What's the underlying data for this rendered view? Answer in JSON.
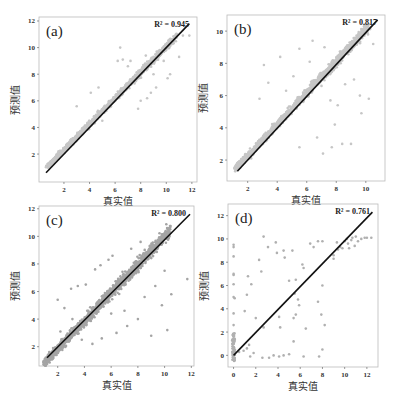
{
  "chart_data": [
    {
      "type": "scatter",
      "panel": "(a)",
      "r2_label": "R² = 0.945",
      "xlabel": "真实值",
      "ylabel": "预测值",
      "xticks": [
        2,
        4,
        6,
        8,
        10,
        12
      ],
      "yticks": [
        2,
        4,
        6,
        8,
        10,
        12
      ],
      "xlim": [
        0.05,
        12.4
      ],
      "ylim": [
        -0.1,
        12.3
      ],
      "box": [
        39,
        17,
        197,
        182
      ],
      "point_color": "#c6c6c6",
      "fit_line": [
        [
          0.6,
          0.6
        ],
        [
          11.8,
          11.8
        ]
      ],
      "seed": 1,
      "dense_spread": 0.45,
      "dense_offset": 0.35,
      "dense_range": [
        0.7,
        10.8
      ],
      "outliers": [
        [
          6.2,
          9.0
        ],
        [
          6.6,
          9.1
        ],
        [
          7.2,
          9.0
        ],
        [
          8.5,
          6.2
        ],
        [
          8.8,
          6.6
        ],
        [
          9.2,
          7.0
        ],
        [
          9.0,
          8.0
        ],
        [
          10.3,
          8.0
        ],
        [
          11.0,
          9.3
        ],
        [
          8.0,
          6.0
        ],
        [
          7.5,
          7.6
        ],
        [
          6.4,
          10.0
        ],
        [
          3.0,
          5.6
        ],
        [
          4.1,
          6.6
        ],
        [
          10.6,
          10.6
        ],
        [
          11.3,
          10.9
        ],
        [
          11.8,
          10.9
        ],
        [
          5.0,
          4.5
        ],
        [
          7.0,
          8.6
        ],
        [
          8.4,
          9.4
        ],
        [
          9.8,
          9.0
        ],
        [
          10.1,
          7.7
        ],
        [
          6.9,
          7.2
        ],
        [
          4.7,
          7.0
        ],
        [
          7.8,
          5.4
        ]
      ]
    },
    {
      "type": "scatter",
      "panel": "(b)",
      "r2_label": "R² = 0.817",
      "xlabel": "真实值",
      "ylabel": "预测值",
      "xticks": [
        2,
        4,
        6,
        8,
        10
      ],
      "yticks": [
        2,
        4,
        6,
        8,
        10
      ],
      "xlim": [
        0.6,
        11.3
      ],
      "ylim": [
        0.7,
        11.0
      ],
      "box": [
        227,
        15,
        385,
        181
      ],
      "point_color": "#c6c6c6",
      "fit_line": [
        [
          1.3,
          1.3
        ],
        [
          10.8,
          10.7
        ]
      ],
      "seed": 2,
      "dense_spread": 0.5,
      "dense_offset": 0.3,
      "dense_range": [
        1.2,
        10.2
      ],
      "outliers": [
        [
          3.4,
          6.8
        ],
        [
          3.1,
          7.9
        ],
        [
          4.2,
          8.4
        ],
        [
          5.5,
          8.9
        ],
        [
          6.2,
          8.1
        ],
        [
          7.0,
          6.6
        ],
        [
          7.6,
          5.7
        ],
        [
          8.1,
          5.4
        ],
        [
          8.6,
          6.7
        ],
        [
          9.2,
          7.0
        ],
        [
          9.6,
          6.0
        ],
        [
          9.7,
          4.9
        ],
        [
          10.2,
          5.8
        ],
        [
          9.0,
          3.0
        ],
        [
          8.4,
          3.0
        ],
        [
          7.7,
          2.8
        ],
        [
          7.1,
          2.4
        ],
        [
          5.5,
          2.8
        ],
        [
          6.7,
          3.4
        ],
        [
          7.9,
          4.2
        ],
        [
          8.9,
          9.0
        ],
        [
          6.4,
          9.4
        ],
        [
          7.2,
          9.0
        ],
        [
          2.8,
          5.8
        ],
        [
          3.8,
          4.0
        ],
        [
          3.0,
          3.2
        ],
        [
          10.5,
          9.2
        ],
        [
          4.6,
          6.3
        ],
        [
          5.1,
          7.2
        ],
        [
          8.3,
          8.0
        ]
      ]
    },
    {
      "type": "scatter",
      "panel": "(c)",
      "r2_label": "R² = 0.800",
      "xlabel": "真实值",
      "ylabel": "预测值",
      "xticks": [
        2,
        4,
        6,
        8,
        10,
        12
      ],
      "yticks": [
        2,
        4,
        6,
        8,
        10,
        12
      ],
      "xlim": [
        0.6,
        12.2
      ],
      "ylim": [
        0.6,
        12.2
      ],
      "box": [
        39,
        206,
        194,
        366
      ],
      "point_color": "#a4a4a4",
      "fit_line": [
        [
          1.2,
          1.2
        ],
        [
          11.9,
          11.6
        ]
      ],
      "seed": 3,
      "dense_spread": 0.8,
      "dense_offset": -0.2,
      "dense_range": [
        1.0,
        10.4
      ],
      "outliers": [
        [
          2.0,
          5.4
        ],
        [
          2.5,
          4.8
        ],
        [
          3.0,
          6.2
        ],
        [
          3.5,
          6.4
        ],
        [
          4.1,
          6.5
        ],
        [
          4.8,
          7.6
        ],
        [
          5.2,
          7.9
        ],
        [
          5.8,
          8.3
        ],
        [
          6.1,
          8.6
        ],
        [
          7.5,
          9.1
        ],
        [
          8.2,
          9.6
        ],
        [
          3.8,
          2.5
        ],
        [
          4.6,
          2.2
        ],
        [
          5.3,
          2.6
        ],
        [
          6.4,
          3.0
        ],
        [
          7.2,
          3.5
        ],
        [
          8.0,
          4.0
        ],
        [
          9.0,
          2.8
        ],
        [
          10.2,
          3.2
        ],
        [
          10.5,
          5.8
        ],
        [
          11.7,
          6.9
        ],
        [
          9.8,
          5.0
        ],
        [
          8.5,
          5.6
        ],
        [
          7.0,
          4.6
        ],
        [
          6.0,
          4.4
        ],
        [
          2.2,
          3.1
        ],
        [
          3.1,
          4.0
        ],
        [
          10.0,
          7.5
        ],
        [
          9.3,
          6.4
        ]
      ]
    },
    {
      "type": "scatter",
      "panel": "(d)",
      "r2_label": "R² = 0.761",
      "xlabel": "真实值",
      "ylabel": "预测值",
      "xticks": [
        0,
        2,
        4,
        6,
        8,
        10,
        12
      ],
      "yticks": [
        0,
        2,
        4,
        6,
        8,
        10,
        12
      ],
      "xlim": [
        -0.5,
        13.0
      ],
      "ylim": [
        -1.0,
        13.0
      ],
      "box": [
        228,
        204,
        378,
        367
      ],
      "point_color": "#b0b0b0",
      "fit_line": [
        [
          0,
          0
        ],
        [
          12.5,
          12.3
        ]
      ],
      "seed": 4,
      "outliers": [
        [
          0,
          9.5
        ],
        [
          0,
          9.3
        ],
        [
          0,
          8.5
        ],
        [
          0,
          7.0
        ],
        [
          0,
          6.9
        ],
        [
          0,
          6.1
        ],
        [
          0,
          5.0
        ],
        [
          0,
          3.6
        ],
        [
          0,
          2.6
        ],
        [
          0.1,
          4.9
        ],
        [
          1.0,
          3.8
        ],
        [
          1.2,
          5.2
        ],
        [
          1.3,
          6.8
        ],
        [
          1.6,
          6.1
        ],
        [
          2.3,
          8.2
        ],
        [
          2.5,
          7.2
        ],
        [
          2.7,
          10.2
        ],
        [
          3.1,
          9.3
        ],
        [
          3.8,
          9.7
        ],
        [
          3.9,
          8.8
        ],
        [
          4.5,
          9.0
        ],
        [
          4.6,
          8.4
        ],
        [
          5.3,
          9.0
        ],
        [
          5.0,
          6.4
        ],
        [
          5.6,
          6.5
        ],
        [
          5.5,
          5.3
        ],
        [
          6.2,
          7.8
        ],
        [
          6.3,
          7.5
        ],
        [
          6.9,
          9.6
        ],
        [
          7.2,
          9.3
        ],
        [
          7.6,
          9.8
        ],
        [
          7.6,
          4.6
        ],
        [
          8.0,
          9.8
        ],
        [
          8.0,
          6.0
        ],
        [
          8.0,
          0.5
        ],
        [
          8.2,
          2.6
        ],
        [
          7.9,
          3.5
        ],
        [
          5.8,
          4.8
        ],
        [
          5.9,
          4.3
        ],
        [
          4.2,
          2.4
        ],
        [
          4.1,
          3.3
        ],
        [
          5.4,
          3.2
        ],
        [
          5.6,
          3.5
        ],
        [
          2.0,
          3.2
        ],
        [
          2.7,
          2.4
        ],
        [
          6.5,
          2.3
        ],
        [
          5.4,
          1.2
        ],
        [
          4.5,
          0
        ],
        [
          5.0,
          0.1
        ],
        [
          6.3,
          -0.1
        ],
        [
          7.7,
          -0.1
        ],
        [
          3.2,
          -0.2
        ],
        [
          3.6,
          0
        ],
        [
          4.1,
          -0.1
        ],
        [
          2.6,
          -0.2
        ],
        [
          1.5,
          -0.1
        ],
        [
          1.8,
          0.2
        ],
        [
          1.2,
          0.6
        ],
        [
          1.4,
          0.9
        ],
        [
          0.9,
          0.4
        ],
        [
          0.5,
          0.3
        ],
        [
          9.0,
          8.6
        ],
        [
          9.0,
          8.3
        ],
        [
          9.3,
          9.7
        ],
        [
          9.6,
          9.3
        ],
        [
          10.0,
          9.8
        ],
        [
          10.3,
          9.6
        ],
        [
          10.6,
          9.9
        ],
        [
          10.9,
          9.4
        ],
        [
          11.2,
          9.8
        ],
        [
          11.5,
          10.0
        ],
        [
          12.0,
          10.1
        ],
        [
          12.4,
          10.1
        ],
        [
          11.8,
          10.1
        ],
        [
          10.4,
          9.2
        ],
        [
          10.7,
          10.1
        ],
        [
          11.0,
          10.2
        ],
        [
          9.8,
          9.2
        ],
        [
          10.2,
          10.0
        ],
        [
          9.4,
          9.1
        ]
      ]
    }
  ],
  "panels": [
    {
      "label": "(a)",
      "r2": "R² = 0.945",
      "xlabel": "真实值",
      "ylabel": "预测值"
    },
    {
      "label": "(b)",
      "r2": "R² = 0.817",
      "xlabel": "真实值",
      "ylabel": "预测值"
    },
    {
      "label": "(c)",
      "r2": "R² = 0.800",
      "xlabel": "真实值",
      "ylabel": "预测值"
    },
    {
      "label": "(d)",
      "r2": "R² = 0.761",
      "xlabel": "真实值",
      "ylabel": "预测值"
    }
  ]
}
